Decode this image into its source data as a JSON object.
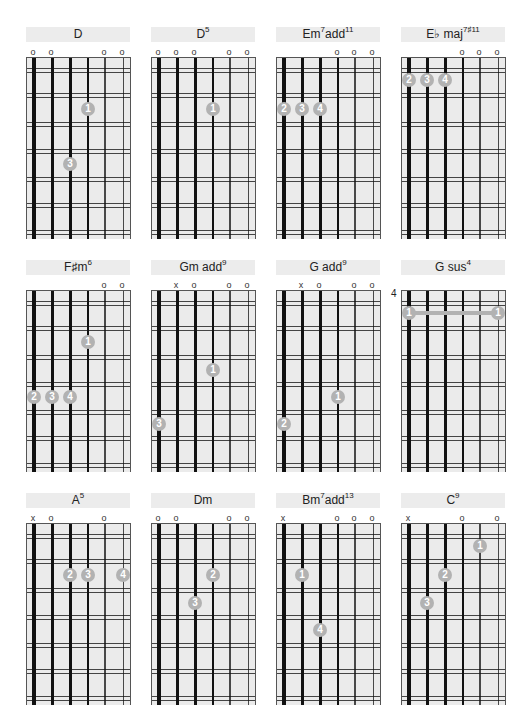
{
  "layout": {
    "columns_x": [
      26,
      151,
      276,
      401
    ],
    "rows_y": [
      27,
      260,
      493
    ]
  },
  "colors": {
    "header_bg": "#ececec",
    "grid_bg": "#ebebeb",
    "dot": "#b2b2b2",
    "string": "#111111"
  },
  "chords": [
    {
      "name": "D",
      "sup": "",
      "markers": [
        "o",
        "o",
        "",
        "",
        "o",
        "o"
      ],
      "dots": [
        {
          "s": 3,
          "f": 2,
          "n": "1"
        },
        {
          "s": 2,
          "f": 4,
          "n": "3"
        }
      ]
    },
    {
      "name": "D",
      "sup": "5",
      "markers": [
        "o",
        "o",
        "o",
        "",
        "o",
        "o"
      ],
      "dots": [
        {
          "s": 3,
          "f": 2,
          "n": "1"
        }
      ]
    },
    {
      "name": "Em",
      "sup": "7",
      "name2": "add",
      "sup2": "11",
      "markers": [
        "",
        "",
        "",
        "o",
        "o",
        "o"
      ],
      "dots": [
        {
          "s": 0,
          "f": 2,
          "n": "2"
        },
        {
          "s": 1,
          "f": 2,
          "n": "3"
        },
        {
          "s": 2,
          "f": 2,
          "n": "4"
        }
      ]
    },
    {
      "name": "E♭ maj",
      "sup": "7♯11",
      "markers": [
        "",
        "",
        "",
        "o",
        "o",
        "o"
      ],
      "dots": [
        {
          "s": 0,
          "f": 1,
          "n": "2"
        },
        {
          "s": 1,
          "f": 1,
          "n": "3"
        },
        {
          "s": 2,
          "f": 1,
          "n": "4"
        }
      ]
    },
    {
      "name": "F♯m",
      "sup": "6",
      "markers": [
        "",
        "",
        "",
        "",
        "o",
        "o"
      ],
      "dots": [
        {
          "s": 3,
          "f": 2,
          "n": "1"
        },
        {
          "s": 0,
          "f": 4,
          "n": "2"
        },
        {
          "s": 1,
          "f": 4,
          "n": "3"
        },
        {
          "s": 2,
          "f": 4,
          "n": "4"
        }
      ]
    },
    {
      "name": "Gm add",
      "sup": "9",
      "markers": [
        "",
        "x",
        "o",
        "",
        "o",
        "o"
      ],
      "dots": [
        {
          "s": 3,
          "f": 3,
          "n": "1"
        },
        {
          "s": 0,
          "f": 5,
          "n": "3"
        }
      ]
    },
    {
      "name": "G add",
      "sup": "9",
      "markers": [
        "",
        "x",
        "o",
        "",
        "o",
        "o"
      ],
      "dots": [
        {
          "s": 3,
          "f": 4,
          "n": "1"
        },
        {
          "s": 0,
          "f": 5,
          "n": "2"
        }
      ]
    },
    {
      "name": "G sus",
      "sup": "4",
      "fret_label": "4",
      "markers": [
        "",
        "",
        "",
        "",
        "",
        ""
      ],
      "barre": {
        "from": 0,
        "to": 5,
        "f": 1
      },
      "dots": [
        {
          "s": 0,
          "f": 1,
          "n": "1"
        },
        {
          "s": 5,
          "f": 1,
          "n": "1"
        }
      ]
    },
    {
      "name": "A",
      "sup": "5",
      "markers": [
        "x",
        "o",
        "",
        "",
        "o",
        ""
      ],
      "dots": [
        {
          "s": 2,
          "f": 2,
          "n": "2"
        },
        {
          "s": 3,
          "f": 2,
          "n": "3"
        },
        {
          "s": 5,
          "f": 2,
          "n": "4"
        }
      ]
    },
    {
      "name": "Dm",
      "sup": "",
      "markers": [
        "o",
        "o",
        "",
        "",
        "o",
        "o"
      ],
      "dots": [
        {
          "s": 3,
          "f": 2,
          "n": "2"
        },
        {
          "s": 2,
          "f": 3,
          "n": "3"
        }
      ]
    },
    {
      "name": "Bm",
      "sup": "7",
      "name2": "add",
      "sup2": "13",
      "markers": [
        "x",
        "",
        "",
        "o",
        "o",
        "o"
      ],
      "dots": [
        {
          "s": 1,
          "f": 2,
          "n": "1"
        },
        {
          "s": 2,
          "f": 4,
          "n": "4"
        }
      ]
    },
    {
      "name": "C",
      "sup": "9",
      "markers": [
        "x",
        "",
        "",
        "o",
        "",
        "o"
      ],
      "dots": [
        {
          "s": 4,
          "f": 1,
          "n": "1"
        },
        {
          "s": 2,
          "f": 2,
          "n": "2"
        },
        {
          "s": 1,
          "f": 3,
          "n": "3"
        }
      ]
    }
  ]
}
